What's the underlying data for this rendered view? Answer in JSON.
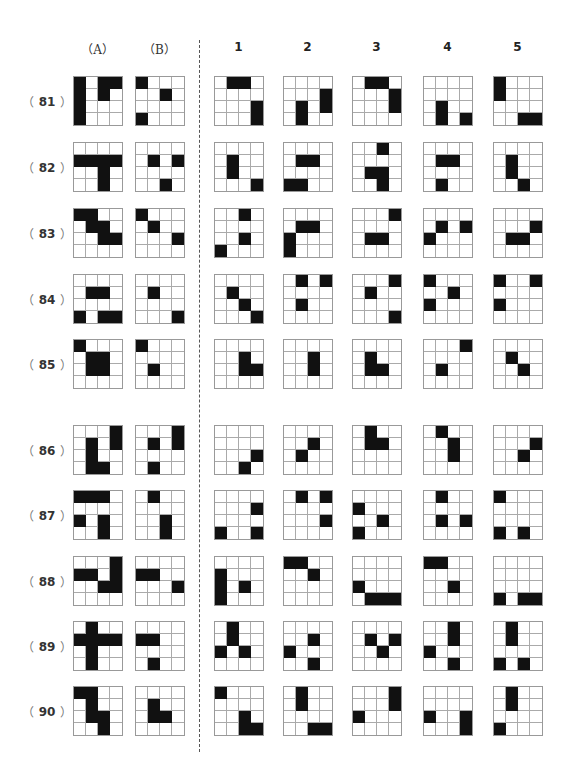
{
  "headers": {
    "a": "（A）",
    "b": "（B）",
    "options": [
      "1",
      "2",
      "3",
      "4",
      "5"
    ]
  },
  "rows": [
    {
      "number": "81",
      "label_open": "（",
      "label_close": "）",
      "a": [
        [
          0,
          0
        ],
        [
          1,
          0
        ],
        [
          2,
          0
        ],
        [
          3,
          0
        ],
        [
          0,
          2
        ],
        [
          0,
          3
        ],
        [
          1,
          2
        ]
      ],
      "b": [
        [
          0,
          0
        ],
        [
          1,
          2
        ],
        [
          3,
          0
        ]
      ],
      "options": [
        [
          [
            0,
            1
          ],
          [
            0,
            2
          ],
          [
            2,
            3
          ],
          [
            3,
            3
          ]
        ],
        [
          [
            1,
            3
          ],
          [
            2,
            3
          ],
          [
            2,
            1
          ],
          [
            3,
            1
          ]
        ],
        [
          [
            0,
            1
          ],
          [
            0,
            2
          ],
          [
            1,
            3
          ],
          [
            2,
            3
          ]
        ],
        [
          [
            2,
            1
          ],
          [
            3,
            1
          ],
          [
            3,
            3
          ]
        ],
        [
          [
            0,
            0
          ],
          [
            1,
            0
          ],
          [
            3,
            2
          ],
          [
            3,
            3
          ]
        ]
      ]
    },
    {
      "number": "82",
      "label_open": "（",
      "label_close": "）",
      "a": [
        [
          1,
          0
        ],
        [
          1,
          1
        ],
        [
          1,
          2
        ],
        [
          1,
          3
        ],
        [
          2,
          2
        ],
        [
          3,
          2
        ]
      ],
      "b": [
        [
          1,
          1
        ],
        [
          1,
          3
        ],
        [
          3,
          2
        ]
      ],
      "options": [
        [
          [
            1,
            1
          ],
          [
            2,
            1
          ],
          [
            3,
            3
          ]
        ],
        [
          [
            1,
            1
          ],
          [
            1,
            2
          ],
          [
            3,
            0
          ],
          [
            3,
            1
          ]
        ],
        [
          [
            0,
            2
          ],
          [
            2,
            1
          ],
          [
            2,
            2
          ],
          [
            3,
            2
          ]
        ],
        [
          [
            1,
            1
          ],
          [
            1,
            2
          ],
          [
            3,
            1
          ]
        ],
        [
          [
            1,
            1
          ],
          [
            2,
            1
          ],
          [
            3,
            2
          ]
        ]
      ]
    },
    {
      "number": "83",
      "label_open": "（",
      "label_close": "）",
      "a": [
        [
          0,
          0
        ],
        [
          0,
          1
        ],
        [
          1,
          1
        ],
        [
          1,
          2
        ],
        [
          2,
          2
        ],
        [
          2,
          3
        ]
      ],
      "b": [
        [
          0,
          0
        ],
        [
          1,
          1
        ],
        [
          2,
          3
        ]
      ],
      "options": [
        [
          [
            0,
            2
          ],
          [
            2,
            2
          ],
          [
            3,
            0
          ]
        ],
        [
          [
            1,
            1
          ],
          [
            1,
            2
          ],
          [
            2,
            0
          ],
          [
            3,
            0
          ]
        ],
        [
          [
            0,
            3
          ],
          [
            2,
            1
          ],
          [
            2,
            2
          ]
        ],
        [
          [
            1,
            1
          ],
          [
            1,
            3
          ],
          [
            2,
            0
          ]
        ],
        [
          [
            1,
            3
          ],
          [
            2,
            1
          ],
          [
            2,
            2
          ]
        ]
      ]
    },
    {
      "number": "84",
      "label_open": "（",
      "label_close": "）",
      "a": [
        [
          1,
          1
        ],
        [
          1,
          2
        ],
        [
          3,
          0
        ],
        [
          3,
          2
        ],
        [
          3,
          3
        ]
      ],
      "b": [
        [
          1,
          1
        ],
        [
          3,
          3
        ]
      ],
      "options": [
        [
          [
            1,
            1
          ],
          [
            2,
            2
          ],
          [
            3,
            3
          ]
        ],
        [
          [
            0,
            1
          ],
          [
            0,
            3
          ],
          [
            2,
            1
          ]
        ],
        [
          [
            0,
            3
          ],
          [
            1,
            1
          ],
          [
            3,
            3
          ]
        ],
        [
          [
            0,
            0
          ],
          [
            1,
            2
          ],
          [
            2,
            0
          ]
        ],
        [
          [
            0,
            0
          ],
          [
            0,
            3
          ],
          [
            2,
            0
          ]
        ]
      ]
    },
    {
      "number": "85",
      "label_open": "（",
      "label_close": "）",
      "a": [
        [
          0,
          0
        ],
        [
          1,
          1
        ],
        [
          1,
          2
        ],
        [
          2,
          1
        ],
        [
          2,
          2
        ]
      ],
      "b": [
        [
          0,
          0
        ],
        [
          2,
          1
        ]
      ],
      "options": [
        [
          [
            1,
            2
          ],
          [
            2,
            2
          ],
          [
            2,
            3
          ]
        ],
        [
          [
            1,
            2
          ],
          [
            2,
            2
          ]
        ],
        [
          [
            1,
            1
          ],
          [
            2,
            1
          ],
          [
            2,
            2
          ]
        ],
        [
          [
            0,
            3
          ],
          [
            2,
            1
          ]
        ],
        [
          [
            1,
            1
          ],
          [
            2,
            2
          ]
        ]
      ]
    },
    {
      "number": "86",
      "label_open": "（",
      "label_close": "）",
      "a": [
        [
          0,
          3
        ],
        [
          1,
          1
        ],
        [
          1,
          3
        ],
        [
          2,
          1
        ],
        [
          3,
          1
        ],
        [
          3,
          2
        ]
      ],
      "b": [
        [
          0,
          3
        ],
        [
          1,
          1
        ],
        [
          1,
          3
        ],
        [
          3,
          1
        ]
      ],
      "options": [
        [
          [
            2,
            3
          ],
          [
            3,
            2
          ]
        ],
        [
          [
            1,
            2
          ],
          [
            2,
            1
          ]
        ],
        [
          [
            0,
            1
          ],
          [
            1,
            1
          ],
          [
            1,
            2
          ]
        ],
        [
          [
            0,
            1
          ],
          [
            1,
            2
          ],
          [
            2,
            2
          ]
        ],
        [
          [
            1,
            3
          ],
          [
            2,
            2
          ]
        ]
      ]
    },
    {
      "number": "87",
      "label_open": "（",
      "label_close": "）",
      "a": [
        [
          0,
          0
        ],
        [
          0,
          1
        ],
        [
          0,
          2
        ],
        [
          2,
          0
        ],
        [
          2,
          2
        ],
        [
          3,
          2
        ]
      ],
      "b": [
        [
          0,
          1
        ],
        [
          2,
          2
        ],
        [
          3,
          2
        ]
      ],
      "options": [
        [
          [
            1,
            3
          ],
          [
            3,
            0
          ],
          [
            3,
            3
          ]
        ],
        [
          [
            0,
            1
          ],
          [
            0,
            3
          ],
          [
            2,
            3
          ]
        ],
        [
          [
            1,
            0
          ],
          [
            2,
            2
          ],
          [
            3,
            0
          ]
        ],
        [
          [
            0,
            1
          ],
          [
            2,
            1
          ],
          [
            2,
            3
          ]
        ],
        [
          [
            0,
            0
          ],
          [
            3,
            0
          ],
          [
            3,
            2
          ]
        ]
      ]
    },
    {
      "number": "88",
      "label_open": "（",
      "label_close": "）",
      "a": [
        [
          0,
          3
        ],
        [
          1,
          0
        ],
        [
          1,
          1
        ],
        [
          1,
          3
        ],
        [
          2,
          2
        ],
        [
          2,
          3
        ]
      ],
      "b": [
        [
          1,
          0
        ],
        [
          1,
          1
        ],
        [
          2,
          3
        ]
      ],
      "options": [
        [
          [
            1,
            0
          ],
          [
            2,
            0
          ],
          [
            3,
            0
          ],
          [
            2,
            2
          ]
        ],
        [
          [
            0,
            0
          ],
          [
            0,
            1
          ],
          [
            1,
            2
          ]
        ],
        [
          [
            2,
            0
          ],
          [
            3,
            1
          ],
          [
            3,
            2
          ],
          [
            3,
            3
          ]
        ],
        [
          [
            0,
            0
          ],
          [
            0,
            1
          ],
          [
            2,
            2
          ]
        ],
        [
          [
            3,
            0
          ],
          [
            3,
            2
          ],
          [
            3,
            3
          ]
        ]
      ]
    },
    {
      "number": "89",
      "label_open": "（",
      "label_close": "）",
      "a": [
        [
          0,
          1
        ],
        [
          1,
          0
        ],
        [
          1,
          1
        ],
        [
          1,
          2
        ],
        [
          1,
          3
        ],
        [
          2,
          1
        ],
        [
          3,
          1
        ]
      ],
      "b": [
        [
          1,
          0
        ],
        [
          1,
          1
        ],
        [
          3,
          1
        ]
      ],
      "options": [
        [
          [
            0,
            1
          ],
          [
            1,
            1
          ],
          [
            2,
            0
          ],
          [
            2,
            2
          ]
        ],
        [
          [
            1,
            2
          ],
          [
            2,
            0
          ],
          [
            3,
            2
          ]
        ],
        [
          [
            1,
            1
          ],
          [
            1,
            3
          ],
          [
            2,
            2
          ]
        ],
        [
          [
            0,
            2
          ],
          [
            1,
            2
          ],
          [
            2,
            0
          ],
          [
            3,
            2
          ]
        ],
        [
          [
            0,
            1
          ],
          [
            1,
            1
          ],
          [
            3,
            0
          ],
          [
            3,
            2
          ]
        ]
      ]
    },
    {
      "number": "90",
      "label_open": "（",
      "label_close": "）",
      "a": [
        [
          0,
          0
        ],
        [
          0,
          1
        ],
        [
          1,
          1
        ],
        [
          2,
          1
        ],
        [
          2,
          2
        ],
        [
          3,
          2
        ]
      ],
      "b": [
        [
          1,
          1
        ],
        [
          2,
          1
        ],
        [
          2,
          2
        ]
      ],
      "options": [
        [
          [
            0,
            0
          ],
          [
            2,
            2
          ],
          [
            3,
            2
          ],
          [
            3,
            3
          ]
        ],
        [
          [
            0,
            1
          ],
          [
            1,
            1
          ],
          [
            3,
            2
          ],
          [
            3,
            3
          ]
        ],
        [
          [
            0,
            3
          ],
          [
            1,
            3
          ],
          [
            2,
            0
          ]
        ],
        [
          [
            2,
            0
          ],
          [
            2,
            3
          ],
          [
            3,
            3
          ]
        ],
        [
          [
            0,
            1
          ],
          [
            1,
            1
          ],
          [
            3,
            0
          ]
        ]
      ]
    }
  ]
}
